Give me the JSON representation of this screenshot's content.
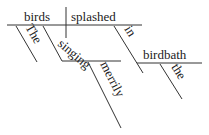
{
  "diagram": {
    "type": "reed-kellogg-sentence-diagram",
    "sentence_words": {
      "subject": "birds",
      "verb": "splashed",
      "subject_article": "The",
      "subject_participle": "singing",
      "participle_adverb": "merrily",
      "preposition": "in",
      "prep_object": "birdbath",
      "object_article": "the"
    },
    "colors": {
      "line": "#333333",
      "text": "#222222",
      "background": "#ffffff"
    }
  }
}
